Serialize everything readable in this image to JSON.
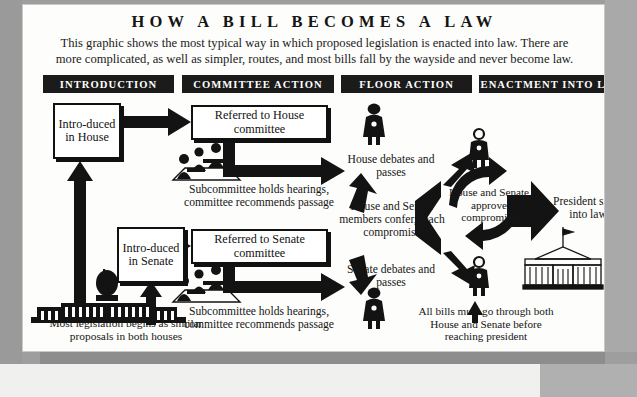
{
  "page": {
    "title": "HOW A BILL BECOMES A LAW",
    "subtitle": "This graphic shows the most typical way in which proposed legislation is enacted into law. There are more complicated, as well as simpler, routes, and most bills fall by the wayside and never become law."
  },
  "colors": {
    "ink": "#131313",
    "bar_background": "#1b1b1b",
    "bar_text": "#ffffff",
    "page_background": "#fdfdfb",
    "surround": "#9e9e9e"
  },
  "stage_bars": [
    {
      "label": "INTRODUCTION"
    },
    {
      "label": "COMMITTEE ACTION"
    },
    {
      "label": "FLOOR ACTION"
    },
    {
      "label": "ENACTMENT INTO LAW"
    }
  ],
  "boxes": [
    {
      "id": "introduced-house",
      "label": "Intro-duced in House"
    },
    {
      "id": "introduced-senate",
      "label": "Intro-duced in Senate"
    },
    {
      "id": "referred-house-committee",
      "label": "Referred to House committee"
    },
    {
      "id": "referred-senate-committee",
      "label": "Referred to Senate committee"
    }
  ],
  "captions": {
    "subcommittee_house": "Subcommittee holds hearings, committee recommends passage",
    "subcommittee_senate": "Subcommittee holds hearings, committee recommends passage",
    "house_debates": "House debates and passes",
    "senate_debates": "Senate debates and passes",
    "confer": "House and Senate members confer, reach compromise",
    "approve": "House and Senate approve compromise",
    "president": "President signs into law",
    "all_bills": "All bills must go through both House and Senate before reaching president",
    "most_legislation": "Most legislation begins as similar proposals in both houses"
  },
  "icons": {
    "capitol": "capitol-building-icon",
    "white_house": "white-house-icon",
    "committee_group_house": "committee-group-icon",
    "committee_group_senate": "committee-group-icon",
    "legislator_house_floor": "legislator-figure-icon",
    "legislator_senate_floor": "legislator-figure-icon",
    "legislator_conference_top": "legislator-figure-icon",
    "legislator_conference_bottom": "legislator-figure-icon"
  }
}
